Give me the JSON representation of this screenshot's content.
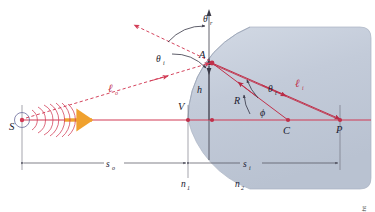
{
  "figure": {
    "credit": "Courtesy of Eugene Hecht",
    "colors": {
      "ray": "#d23b55",
      "ray_dark": "#a02038",
      "glass_fill": "#c5cdda",
      "glass_edge": "#a8b2c4",
      "axis": "#4a4a58",
      "label": "#1a1a2e",
      "arrow_orange": "#f0a12e",
      "wavefront": "#d23b55",
      "background": "#ffffff"
    },
    "labels": {
      "source": "S",
      "vertex": "V",
      "point_a": "A",
      "center": "C",
      "image_point": "P",
      "height": "h",
      "radius": "R",
      "theta_r": "θ",
      "theta_r_sub": "r",
      "theta_i": "θ",
      "theta_i_sub": "i",
      "theta_t": "θ",
      "theta_t_sub": "t",
      "phi": "ϕ",
      "ell_o": "ℓ",
      "ell_o_sub": "o",
      "ell_i": "ℓ",
      "ell_i_sub": "i",
      "n1": "n",
      "n1_sub": "1",
      "n2": "n",
      "n2_sub": "2",
      "s_o": "s",
      "s_o_sub": "o",
      "s_i": "s",
      "s_i_sub": "i"
    },
    "geometry": {
      "source_x": 22,
      "source_y": 120,
      "vertex_x": 188,
      "vertex_y": 120,
      "point_a_x": 212,
      "point_a_y": 62,
      "center_x": 288,
      "center_y": 120,
      "image_p_x": 340,
      "image_p_y": 120,
      "axis_y": 120
    }
  }
}
